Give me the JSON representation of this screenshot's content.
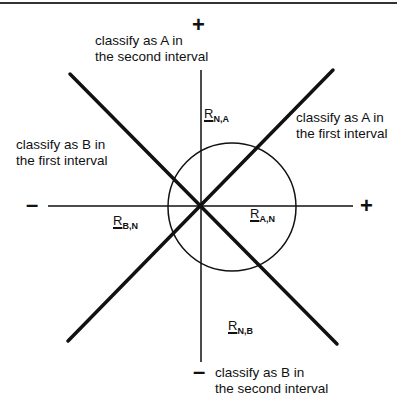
{
  "figure": {
    "axis_signs": {
      "top": "+",
      "bottom": "–",
      "left": "–",
      "right": "+"
    },
    "region_labels": {
      "top": {
        "line1": "classify as A in",
        "line2": "the second interval"
      },
      "right": {
        "line1": "classify as A in",
        "line2": "the first interval"
      },
      "left": {
        "line1": "classify as B in",
        "line2": "the first interval"
      },
      "bottom": {
        "line1": "classify as B in",
        "line2": "the second interval"
      }
    },
    "vectors": {
      "n_a": {
        "symbol": "R",
        "subscript": "N,A"
      },
      "b_n": {
        "symbol": "R",
        "subscript": "B,N"
      },
      "a_n": {
        "symbol": "R",
        "subscript": "A,N"
      },
      "n_b": {
        "symbol": "R",
        "subscript": "N,B"
      }
    },
    "colors": {
      "ink": "#111111",
      "background": "#ffffff"
    }
  }
}
